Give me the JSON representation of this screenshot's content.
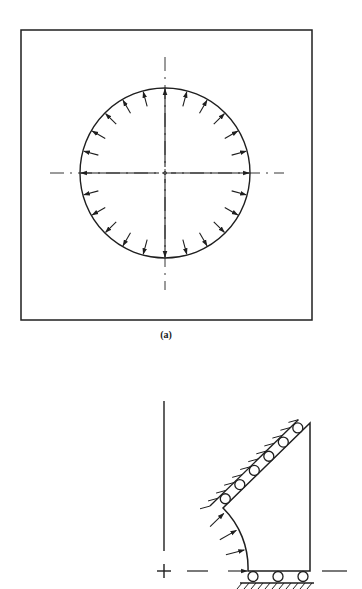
{
  "figure_a": {
    "caption": "(a)",
    "caption_pos": [
      166,
      329
    ],
    "plate": {
      "x": 21,
      "y": 30,
      "w": 291,
      "h": 290
    },
    "hole": {
      "cx": 165,
      "cy": 173,
      "r": 85
    },
    "arrow_count": 24,
    "arrow_length": 16,
    "centerline_h": {
      "y": 173,
      "x1": 50,
      "x2": 284
    },
    "centerline_v": {
      "x": 165,
      "y1": 57,
      "y2": 290
    }
  },
  "figure_b": {
    "axis_v": {
      "x": 164,
      "y1": 401,
      "y2": 551
    },
    "axis_plus": {
      "x": 164,
      "y": 571
    },
    "centerline_dashes": [
      [
        187,
        208
      ],
      [
        322,
        347
      ]
    ],
    "shape": {
      "arc_start": [
        223,
        508
      ],
      "arc_end": [
        248,
        571
      ],
      "arc_center": [
        164,
        571
      ],
      "bottom_right": [
        310,
        571
      ],
      "top_right": [
        310,
        423
      ]
    },
    "arc_arrows": 4,
    "diagonal_rollers": 6,
    "bottom_rollers": 3,
    "diagonal_hatches": 12,
    "ground_hatches": 11
  },
  "colors": {
    "ink": "#1f1f1f",
    "background": "#ffffff"
  }
}
